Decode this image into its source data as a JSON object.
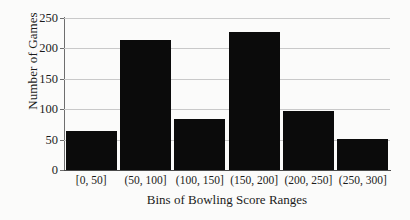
{
  "chart_data": {
    "type": "bar",
    "title": "",
    "xlabel": "Bins of Bowling Score Ranges",
    "ylabel": "Number of Games",
    "categories": [
      "[0, 50]",
      "(50, 100]",
      "(100, 150]",
      "(150, 200]",
      "(200, 250]",
      "(250, 300]"
    ],
    "values": [
      64,
      214,
      84,
      227,
      97,
      51
    ],
    "ylim": [
      0,
      250
    ],
    "yticks": [
      0,
      50,
      100,
      150,
      200,
      250
    ],
    "ytick_labels": [
      "0",
      "50",
      "100",
      "150",
      "200",
      "250"
    ],
    "grid": true,
    "legend": false,
    "bar_color": "#0b0b0b",
    "gridline_color": "#c9c9c9",
    "axis_color": "#4a4a4a",
    "background_color": "#fbfbfa"
  }
}
